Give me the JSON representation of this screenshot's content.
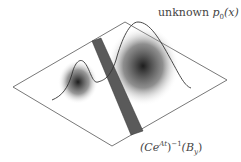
{
  "diagram": {
    "label_top": {
      "prefix": "unknown ",
      "var": "p",
      "sub": "0",
      "arg": "(x)"
    },
    "label_bottom": {
      "open": "(C",
      "e": "e",
      "exp": "At",
      "close": ")",
      "inv": "−1",
      "arg_open": "(B",
      "arg_sub": "y",
      "arg_close": ")"
    },
    "colors": {
      "plane_stroke": "#555555",
      "band_fill": "#5a5a5a",
      "curve": "#333333",
      "blob": "#1a1a1a"
    }
  }
}
